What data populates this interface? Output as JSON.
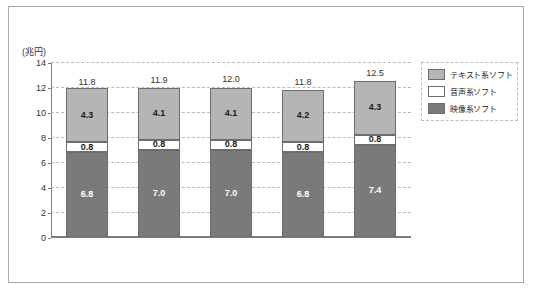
{
  "figure": {
    "unit_label": "(兆円)",
    "y_axis_label": "",
    "x_axis_label": ""
  },
  "legend": {
    "items": [
      {
        "label": "テキスト系ソフト",
        "color": "#b5b5b5",
        "key": "text"
      },
      {
        "label": "音声系ソフト",
        "color": "#ffffff",
        "key": "audio"
      },
      {
        "label": "映像系ソフト",
        "color": "#7a7a7a",
        "key": "video"
      }
    ]
  },
  "axis": {
    "y_ticks": [
      "0",
      "2",
      "4",
      "6",
      "8",
      "10",
      "12",
      "14"
    ],
    "x_ticks": [
      "2017年",
      "2018年",
      "2019年",
      "2020年",
      "2021年"
    ]
  },
  "bars": [
    {
      "category": "2017年",
      "total": "11.8",
      "video": "6.8",
      "audio": "0.8",
      "text": "4.3"
    },
    {
      "category": "2018年",
      "total": "11.9",
      "video": "7.0",
      "audio": "0.8",
      "text": "4.1"
    },
    {
      "category": "2019年",
      "total": "12.0",
      "video": "7.0",
      "audio": "0.8",
      "text": "4.1"
    },
    {
      "category": "2020年",
      "total": "11.8",
      "video": "6.8",
      "audio": "0.8",
      "text": "4.2"
    },
    {
      "category": "2021年",
      "total": "12.5",
      "video": "7.4",
      "audio": "0.8",
      "text": "4.3"
    }
  ],
  "chart_data": {
    "type": "bar",
    "stacked": true,
    "title": "",
    "subtitle": "",
    "xlabel": "",
    "ylabel": "(兆円)",
    "unit": "兆円",
    "categories": [
      "2017年",
      "2018年",
      "2019年",
      "2020年",
      "2021年"
    ],
    "series": [
      {
        "name": "映像系ソフト",
        "values": [
          6.8,
          7.0,
          7.0,
          6.8,
          7.4
        ],
        "color": "#7a7a7a"
      },
      {
        "name": "音声系ソフト",
        "values": [
          0.8,
          0.8,
          0.8,
          0.8,
          0.8
        ],
        "color": "#ffffff"
      },
      {
        "name": "テキスト系ソフト",
        "values": [
          4.3,
          4.1,
          4.1,
          4.2,
          4.3
        ],
        "color": "#b5b5b5"
      }
    ],
    "totals": [
      11.8,
      11.9,
      12.0,
      11.8,
      12.5
    ],
    "ylim": [
      0,
      14
    ],
    "ytick_step": 2,
    "yticks": [
      0,
      2,
      4,
      6,
      8,
      10,
      12,
      14
    ],
    "grid": true,
    "grid_style": "dashed-horizontal",
    "legend_position": "right-outside",
    "data_labels": true
  }
}
